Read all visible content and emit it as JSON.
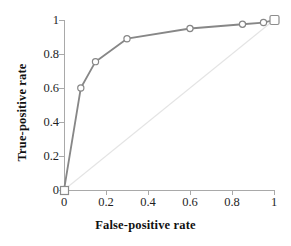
{
  "chart_data": {
    "type": "line",
    "title": "",
    "xlabel": "False-positive rate",
    "ylabel": "True-positive rate",
    "xlim": [
      0,
      1
    ],
    "ylim": [
      0,
      1
    ],
    "grid": false,
    "legend": "none",
    "xticks": [
      "0",
      "0.2",
      "0.4",
      "0.6",
      "0.8",
      "1"
    ],
    "yticks": [
      "0",
      "0.2",
      "0.4",
      "0.6",
      "0.8",
      "1"
    ],
    "xtick_values": [
      0,
      0.2,
      0.4,
      0.6,
      0.8,
      1
    ],
    "ytick_values": [
      0,
      0.2,
      0.4,
      0.6,
      0.8,
      1
    ],
    "series": [
      {
        "name": "ROC curve",
        "marker": "open-circle",
        "color": "#878787",
        "x": [
          0,
          0.08,
          0.15,
          0.3,
          0.6,
          0.85,
          0.95,
          1
        ],
        "y": [
          0,
          0.6,
          0.755,
          0.89,
          0.95,
          0.975,
          0.985,
          1
        ]
      },
      {
        "name": "Chance diagonal",
        "marker": "none",
        "color": "#e4e4e4",
        "x": [
          0,
          1
        ],
        "y": [
          0,
          1
        ]
      }
    ],
    "annotations": [
      {
        "name": "origin-square-marker",
        "x": 0,
        "y": 0,
        "shape": "open-square"
      },
      {
        "name": "corner-square-marker",
        "x": 1,
        "y": 1,
        "shape": "open-square"
      }
    ]
  },
  "axes": {
    "x_title": "False-positive rate",
    "y_title": "True-positive rate",
    "x_tick_labels": [
      "0",
      "0.2",
      "0.4",
      "0.6",
      "0.8",
      "1"
    ],
    "y_tick_labels": [
      "0",
      "0.2",
      "0.4",
      "0.6",
      "0.8",
      "1"
    ]
  },
  "colors": {
    "curve": "#878787",
    "diagonal": "#e4e4e4",
    "axis": "#a9a9a9",
    "text": "#111111",
    "background": "#ffffff"
  }
}
